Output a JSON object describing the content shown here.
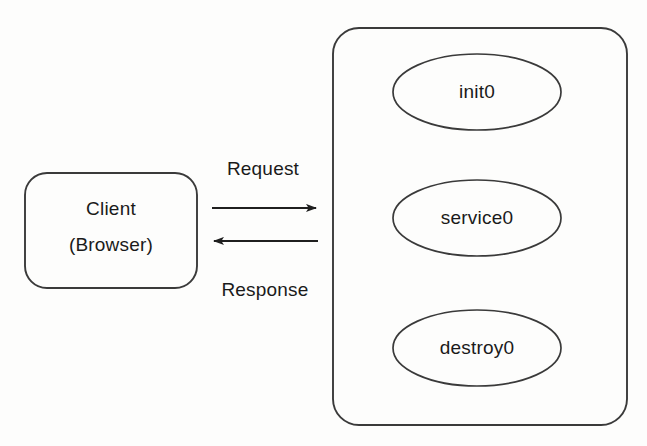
{
  "diagram": {
    "background_color": "#fdfdfc",
    "stroke_color": "#3a3a3a",
    "text_color": "#1a1a1a",
    "client": {
      "name": "client-box",
      "line1": "Client",
      "line2": "(Browser)"
    },
    "container": {
      "name": "servlet-container-box",
      "label": ""
    },
    "lifecycle_nodes": [
      {
        "name": "init-node",
        "label": "init0"
      },
      {
        "name": "service-node",
        "label": "service0"
      },
      {
        "name": "destroy-node",
        "label": "destroy0"
      }
    ],
    "edges": [
      {
        "name": "request-arrow",
        "label": "Request",
        "direction": "client-to-container"
      },
      {
        "name": "response-arrow",
        "label": "Response",
        "direction": "container-to-client"
      }
    ],
    "caption": ""
  }
}
